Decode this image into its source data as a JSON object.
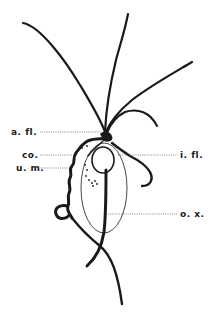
{
  "figure": {
    "labels": {
      "anterior_flagella": "a. fl.",
      "costa": "co.",
      "undulating_membrane": "u. m.",
      "internal_flagellum": "i. fl.",
      "axostyle": "o. x."
    },
    "colors": {
      "ink": "#1a1a1a",
      "leader_line": "#555555",
      "background": "#ffffff"
    }
  }
}
